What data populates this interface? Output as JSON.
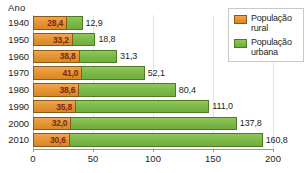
{
  "chart_data": {
    "type": "bar",
    "orientation": "horizontal",
    "stacked": true,
    "title": "",
    "subtitle": "",
    "xlabel": "",
    "ylabel": "Ano",
    "xlim": [
      0,
      200
    ],
    "xticks": [
      "0",
      "50",
      "100",
      "150",
      "200"
    ],
    "xtick_values": [
      0,
      50,
      100,
      150,
      200
    ],
    "grid": true,
    "legend_position": "top-right",
    "categories": [
      "1940",
      "1950",
      "1960",
      "1970",
      "1980",
      "1990",
      "2000",
      "2010"
    ],
    "series": [
      {
        "name": "População rural",
        "color": "#e2922f",
        "values": [
          28.4,
          33.2,
          38.8,
          41.0,
          38.6,
          35.8,
          32.0,
          30.6
        ],
        "labels": [
          "28,4",
          "33,2",
          "38,8",
          "41,0",
          "38,6",
          "35,8",
          "32,0",
          "30,6"
        ]
      },
      {
        "name": "População urbana",
        "color": "#7ab648",
        "values": [
          12.9,
          18.8,
          31.3,
          52.1,
          80.4,
          111.0,
          137.8,
          160.8
        ],
        "labels": [
          "12,9",
          "18,8",
          "31,3",
          "52,1",
          "80,4",
          "111,0",
          "137,8",
          "160,8"
        ]
      }
    ]
  },
  "axis": {
    "y_title": "Ano"
  },
  "legend": {
    "items": [
      {
        "label": "População rural",
        "swatch": "rural"
      },
      {
        "label": "População urbana",
        "swatch": "urbana"
      }
    ]
  },
  "colors": {
    "rural": "#e2922f",
    "urbana": "#7ab648",
    "rural_border": "#8a5a16",
    "urbana_border": "#4e7a22",
    "grid": "#e4e4e4",
    "axis": "#9a9a9a",
    "text": "#231f20",
    "rural_label_text": "#7c2718"
  }
}
